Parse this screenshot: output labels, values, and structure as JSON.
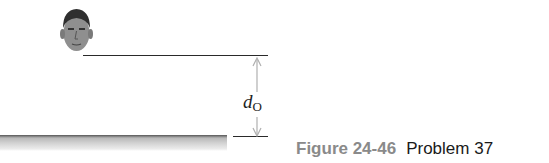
{
  "figure": {
    "label_main": "d",
    "label_sub": "O",
    "caption_figure": "Figure 24-46",
    "caption_problem": "Problem 37",
    "colors": {
      "caption_figure": "#8a8a8a",
      "caption_problem": "#1a1a1a",
      "lines": "#2a2a2a",
      "arrow": "#b0b0b0",
      "mirror_top": "#555555"
    },
    "elements": [
      "head-figure",
      "eye-level-line",
      "mirror-surface",
      "distance-arrow",
      "mirror-level-line"
    ]
  }
}
